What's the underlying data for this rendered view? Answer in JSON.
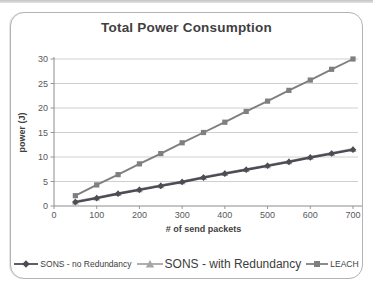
{
  "figure": {
    "colors": {
      "title_text": "#3f3f3f",
      "tick_text": "#595959",
      "axis_line": "#8c8c8c",
      "gridline": "#c9c9c9",
      "box_border": "#b3b3b3",
      "top_strip": "#d2d2d2"
    }
  },
  "chart_data": {
    "type": "line",
    "title": "Total Power Consumption",
    "xlabel": "# of send packets",
    "ylabel": "power (J)",
    "x": [
      50,
      100,
      150,
      200,
      250,
      300,
      350,
      400,
      450,
      500,
      550,
      600,
      650,
      700
    ],
    "x_ticks": [
      0,
      100,
      200,
      300,
      400,
      500,
      600,
      700
    ],
    "y_ticks": [
      0,
      5,
      10,
      15,
      20,
      25,
      30
    ],
    "xlim": [
      0,
      700
    ],
    "ylim": [
      0,
      30
    ],
    "grid": "horizontal-only",
    "legend_position": "bottom",
    "draw_order": [
      1,
      2,
      0
    ],
    "series": [
      {
        "name": "SONS - no Redundancy",
        "marker": "diamond",
        "color": "#4c4c54",
        "line_width": 2.4,
        "values": [
          0.8,
          1.6,
          2.5,
          3.3,
          4.1,
          4.9,
          5.8,
          6.6,
          7.4,
          8.2,
          9.0,
          9.9,
          10.7,
          11.5
        ]
      },
      {
        "name": "SONS - with Redundancy",
        "marker": "triangle",
        "color": "#a6a6a6",
        "line_width": 2.2,
        "values": [
          0.9,
          1.7,
          2.6,
          3.4,
          4.2,
          5.0,
          5.9,
          6.7,
          7.5,
          8.3,
          9.1,
          10.0,
          10.8,
          11.6
        ]
      },
      {
        "name": "LEACH",
        "marker": "square",
        "color": "#7f7f7f",
        "line_width": 1.9,
        "values": [
          2.1,
          4.3,
          6.4,
          8.6,
          10.7,
          12.9,
          15.0,
          17.1,
          19.3,
          21.4,
          23.6,
          25.7,
          27.9,
          30.0
        ]
      }
    ]
  }
}
